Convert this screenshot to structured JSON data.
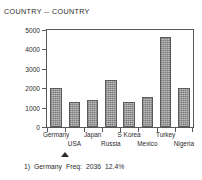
{
  "chart_data": {
    "type": "bar",
    "title": "COUNTRY -- COUNTRY",
    "xlabel": "",
    "ylabel": "",
    "ylim": [
      0,
      5000
    ],
    "yticks": [
      5000,
      4000,
      3000,
      2000,
      1000,
      0
    ],
    "grid": false,
    "legend": false,
    "categories": [
      "Germany",
      "USA",
      "Japan",
      "Russia",
      "S Korea",
      "Mexico",
      "Turkey",
      "Nigeria"
    ],
    "values": [
      2036,
      1290,
      1370,
      2440,
      1290,
      1530,
      4620,
      1990
    ],
    "bar_color": "#8e8e90",
    "bar_edge_color": "#5b5b5d",
    "axis_color": "#58585a"
  },
  "status": {
    "index": "1)",
    "category": "Germany",
    "freq_label": "Freq:",
    "freq_value": "2036",
    "percent": "12.4%"
  },
  "marker": {
    "name": "selection-triangle",
    "points_to": "Germany"
  }
}
